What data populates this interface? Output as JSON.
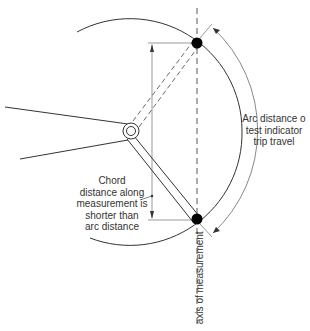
{
  "labels": {
    "arc_distance": [
      "Arc distance o",
      "test indicator",
      "trip travel"
    ],
    "chord_distance": [
      "Chord",
      "distance along",
      "measurement is",
      "shorter than",
      "arc distance"
    ],
    "axis": "axis of measurement"
  },
  "colors": {
    "line": "#333333",
    "ball": "#000000",
    "background": "#ffffff"
  }
}
